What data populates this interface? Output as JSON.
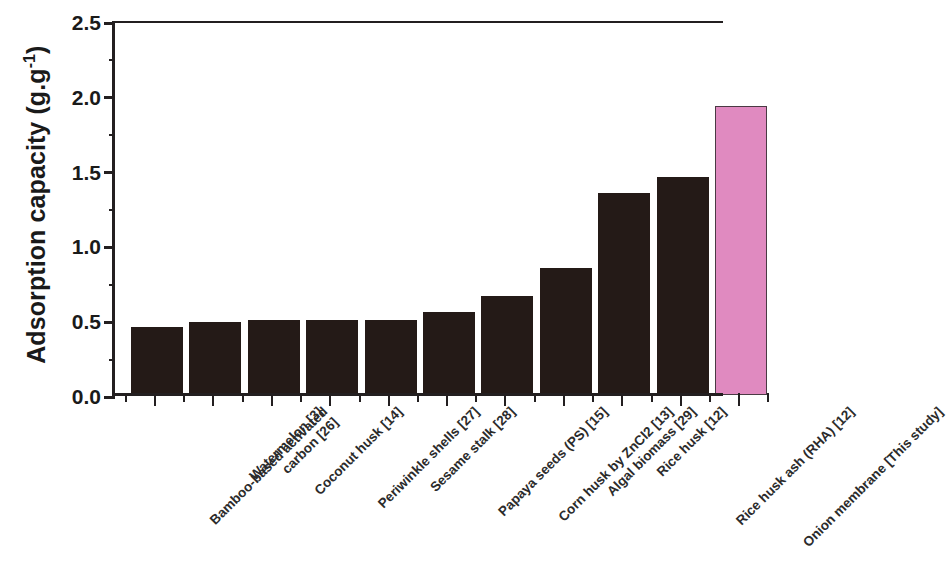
{
  "chart_data": {
    "type": "bar",
    "title": "",
    "xlabel": "",
    "ylabel": "Adsorption capacity (g.g-1)",
    "ylabel_base": "Adsorption capacity (g.g",
    "ylabel_sup": "-1",
    "ylabel_close": ")",
    "ylim": [
      0.0,
      2.5
    ],
    "ytick_labels": [
      "0.0",
      "0.5",
      "1.0",
      "1.5",
      "2.0",
      "2.5"
    ],
    "ytick_values": [
      0.0,
      0.5,
      1.0,
      1.5,
      2.0,
      2.5
    ],
    "yminor_values": [
      0.25,
      0.75,
      1.25,
      1.75,
      2.25
    ],
    "grid": false,
    "legend": null,
    "categories": [
      "Bamboo-based activated carbon [26]",
      "Watermelon [3]",
      "Coconut husk [14]",
      "Periwinkle shells [27]",
      "Sesame stalk [28]",
      "Papaya seeds (PS) [15]",
      "Corn husk by ZnCl2 [13]",
      "Algal biomass [29]",
      "Rice husk [12]",
      "Rice husk ash (RHA) [12]",
      "Onion membrane [This study]"
    ],
    "category_lines": [
      [
        "Bamboo-based activated",
        "carbon [26]"
      ],
      [
        "Watermelon [3]"
      ],
      [
        "Coconut husk [14]"
      ],
      [
        "Periwinkle shells [27]"
      ],
      [
        "Sesame stalk [28]"
      ],
      [
        "Papaya seeds (PS) [15]"
      ],
      [
        "Corn husk by ZnCl2 [13]"
      ],
      [
        "Algal biomass [29]"
      ],
      [
        "Rice husk [12]"
      ],
      [
        "Rice husk ash (RHA) [12]"
      ],
      [
        "Onion membrane [This study]"
      ]
    ],
    "values": [
      0.455,
      0.49,
      0.5,
      0.5,
      0.5,
      0.555,
      0.665,
      0.85,
      1.35,
      1.46,
      1.93
    ],
    "bar_colors": [
      "#241a17",
      "#241a17",
      "#241a17",
      "#241a17",
      "#241a17",
      "#241a17",
      "#241a17",
      "#241a17",
      "#241a17",
      "#241a17",
      "#e08ac0"
    ],
    "highlight_index": 10,
    "colors": {
      "bar_default": "#241a17",
      "bar_highlight": "#e08ac0",
      "axis": "#231f20",
      "text": "#1a1a1a",
      "background": "#ffffff"
    }
  }
}
